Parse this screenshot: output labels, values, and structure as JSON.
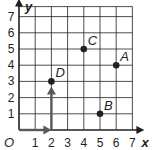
{
  "chart_data": {
    "type": "scatter",
    "title": "",
    "xlabel": "x",
    "ylabel": "y",
    "origin_label": "O",
    "xlim": [
      0,
      7
    ],
    "ylim": [
      0,
      7
    ],
    "grid": true,
    "x_ticks": [
      "1",
      "2",
      "3",
      "4",
      "5",
      "6",
      "7"
    ],
    "y_ticks": [
      "1",
      "2",
      "3",
      "4",
      "5",
      "6",
      "7"
    ],
    "points": [
      {
        "label": "A",
        "x": 6,
        "y": 4
      },
      {
        "label": "B",
        "x": 5,
        "y": 1
      },
      {
        "label": "C",
        "x": 4,
        "y": 5
      },
      {
        "label": "D",
        "x": 2,
        "y": 3
      }
    ],
    "arrows": [
      {
        "from": [
          0,
          0
        ],
        "to": [
          2,
          0
        ],
        "description": "horizontal move 2 right"
      },
      {
        "from": [
          2,
          0
        ],
        "to": [
          2,
          3
        ],
        "description": "vertical move 3 up"
      }
    ]
  },
  "colors": {
    "ink": "#231f20",
    "arrow": "#58595b",
    "grid": "#231f20"
  }
}
